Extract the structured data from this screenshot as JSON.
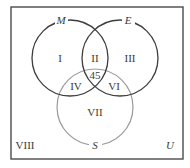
{
  "diagram": {
    "type": "venn",
    "universe_label": "U",
    "colors": {
      "frame": "#4a4a4a",
      "set_M": "#3d3d3d",
      "set_E": "#3d3d3d",
      "set_S": "#9a9a9a",
      "text": "#3a3a3a",
      "background": "#ffffff"
    },
    "sets": [
      {
        "id": "M",
        "label": "M"
      },
      {
        "id": "E",
        "label": "E"
      },
      {
        "id": "S",
        "label": "S"
      }
    ],
    "regions": {
      "I": "I",
      "II": "II",
      "III": "III",
      "IV": "IV",
      "VI": "VI",
      "VII": "VII",
      "VIII": "VIII",
      "center_value": "45"
    }
  }
}
